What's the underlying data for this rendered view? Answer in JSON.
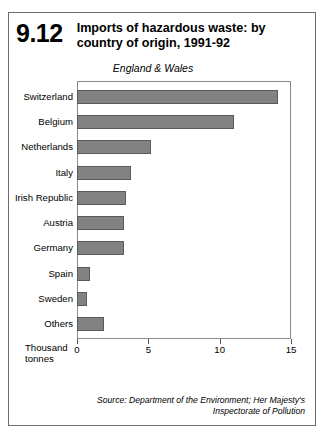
{
  "figure": {
    "number": "9.12",
    "title": "Imports of hazardous waste: by country of origin, 1991-92",
    "subtitle": "England & Wales",
    "source": "Source: Department of the Environment; Her Majesty's Inspectorate of Pollution"
  },
  "axis": {
    "unit_label_line1": "Thousand",
    "unit_label_line2": "tonnes"
  },
  "chart_data": {
    "type": "bar",
    "orientation": "horizontal",
    "title": "Imports of hazardous waste: by country of origin, 1991-92",
    "subtitle": "England & Wales",
    "xlabel": "Thousand tonnes",
    "ylabel": "",
    "xlim": [
      0,
      15
    ],
    "xticks": [
      0,
      5,
      10,
      15
    ],
    "xtick_labels": [
      "0",
      "5",
      "10",
      "15"
    ],
    "grid": false,
    "legend": false,
    "bar_color": "#828282",
    "categories": [
      "Switzerland",
      "Belgium",
      "Netherlands",
      "Italy",
      "Irish Republic",
      "Austria",
      "Germany",
      "Spain",
      "Sweden",
      "Others"
    ],
    "values": [
      14.1,
      11.0,
      5.2,
      3.8,
      3.4,
      3.3,
      3.3,
      0.9,
      0.7,
      1.9
    ]
  }
}
